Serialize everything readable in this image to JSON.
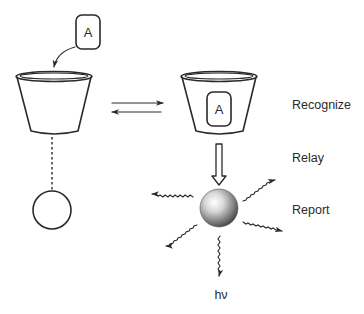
{
  "diagram": {
    "analyte_label": "A",
    "bound_analyte_label": "A",
    "stages": {
      "recognize": "Recognize",
      "relay": "Relay",
      "report": "Report"
    },
    "emission_label": "hν",
    "colors": {
      "line": "#2a2a2a",
      "background": "#ffffff",
      "sphere_light": "#ffffff",
      "sphere_dark": "#4a4a4a"
    }
  }
}
